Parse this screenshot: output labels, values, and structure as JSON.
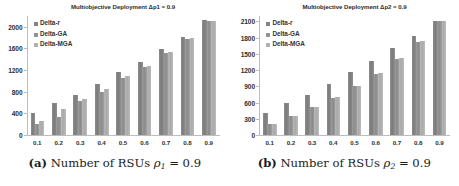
{
  "figure": {
    "subfigures": [
      {
        "caption_tag": "(a)",
        "caption_text": "Number of RSUs",
        "caption_symbol": "ρ",
        "caption_sub": "1",
        "caption_value": "= 0.9"
      },
      {
        "caption_tag": "(b)",
        "caption_text": "Number of RSUs",
        "caption_symbol": "ρ",
        "caption_sub": "2",
        "caption_value": "= 0.9"
      }
    ]
  },
  "chart_data": [
    {
      "type": "bar",
      "title": "Multiobjective Deployment Δp1 = 0.9",
      "xlabel": "",
      "ylabel": "",
      "categories": [
        "0.1",
        "0.2",
        "0.3",
        "0.4",
        "0.5",
        "0.6",
        "0.7",
        "0.8",
        "0.9"
      ],
      "yticks": [
        0,
        400,
        800,
        1200,
        1600,
        2000
      ],
      "ylim": [
        0,
        2200
      ],
      "grid": false,
      "legend_position": "top-left",
      "series": [
        {
          "name": "Delta-r",
          "values": [
            400,
            590,
            735,
            940,
            1165,
            1355,
            1585,
            1820,
            2120
          ]
        },
        {
          "name": "Delta-GA",
          "values": [
            205,
            340,
            620,
            790,
            1045,
            1250,
            1510,
            1770,
            2110
          ]
        },
        {
          "name": "Delta-MGA",
          "values": [
            265,
            475,
            660,
            855,
            1085,
            1285,
            1530,
            1790,
            2110
          ]
        }
      ]
    },
    {
      "type": "bar",
      "title": "Multiobjective Deployment Δp2 = 0.9",
      "xlabel": "",
      "ylabel": "",
      "categories": [
        "0.1",
        "0.2",
        "0.3",
        "0.4",
        "0.5",
        "0.6",
        "0.7",
        "0.8",
        "0.9"
      ],
      "yticks": [
        0,
        300,
        600,
        900,
        1200,
        1500,
        1800,
        2100
      ],
      "ylim": [
        0,
        2200
      ],
      "grid": false,
      "legend_position": "top-left",
      "series": [
        {
          "name": "Delta-r",
          "values": [
            400,
            595,
            740,
            950,
            1165,
            1375,
            1600,
            1825,
            2110
          ]
        },
        {
          "name": "Delta-GA",
          "values": [
            200,
            345,
            520,
            680,
            900,
            1130,
            1405,
            1715,
            2105
          ]
        },
        {
          "name": "Delta-MGA",
          "values": [
            205,
            350,
            525,
            700,
            900,
            1155,
            1430,
            1740,
            2105
          ]
        }
      ]
    }
  ]
}
